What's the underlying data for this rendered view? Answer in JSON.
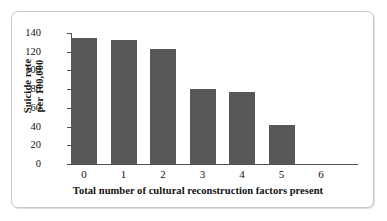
{
  "figure": {
    "bar_color": "#585858",
    "axis_color": "#4f4f4f",
    "frame_color": "#c9c9c9",
    "background": "#ffffff"
  },
  "chart_data": {
    "type": "bar",
    "title": "",
    "xlabel": "Total number of cultural reconstruction factors present",
    "ylabel": "Suicide rate per 100,000",
    "ylabel_line1": "Suicide rate",
    "ylabel_line2": "per 100,000",
    "categories": [
      "0",
      "1",
      "2",
      "3",
      "4",
      "5",
      "6"
    ],
    "values": [
      135,
      132,
      123,
      80,
      77,
      42,
      0
    ],
    "ylim": [
      0,
      140
    ],
    "yticks": [
      0,
      20,
      40,
      60,
      80,
      100,
      120,
      140
    ],
    "ytick_labels": [
      "0",
      "20",
      "40",
      "60",
      "80",
      "100",
      "120",
      "140"
    ],
    "xtick_labels": [
      "0",
      "1",
      "2",
      "3",
      "4",
      "5",
      "6"
    ],
    "grid": false,
    "legend": false
  }
}
